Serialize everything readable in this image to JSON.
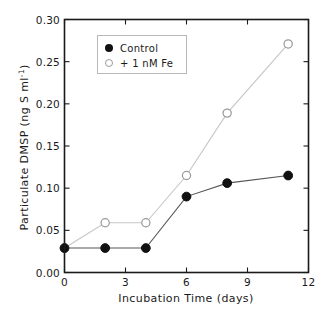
{
  "chart_data": {
    "type": "line",
    "title": "",
    "xlabel": "Incubation Time (days)",
    "ylabel_main": "Particulate DMSP (ng S ml",
    "ylabel_sup": "-1",
    "ylabel_tail": ")",
    "ylabel_full": "Particulate DMSP (ng S ml-1)",
    "xlim": [
      0,
      12
    ],
    "ylim": [
      0.0,
      0.3
    ],
    "xticks": [
      0,
      3,
      6,
      9,
      12
    ],
    "xtick_labels": [
      "0",
      "3",
      "6",
      "9",
      "12"
    ],
    "yticks": [
      0.0,
      0.05,
      0.1,
      0.15,
      0.2,
      0.25,
      0.3
    ],
    "ytick_labels": [
      "0.00",
      "0.05",
      "0.10",
      "0.15",
      "0.20",
      "0.25",
      "0.30"
    ],
    "grid": false,
    "legend_position": "upper-left-inside",
    "series": [
      {
        "name": "Control",
        "marker": "filled-circle",
        "color": "#111111",
        "line_color": "#555555",
        "x": [
          0,
          2,
          4,
          6,
          8,
          11
        ],
        "values": [
          0.029,
          0.029,
          0.029,
          0.09,
          0.106,
          0.115
        ]
      },
      {
        "name": "+ 1 nM Fe",
        "marker": "open-circle",
        "color": "#ffffff",
        "line_color": "#c6c6c6",
        "x": [
          0,
          2,
          4,
          6,
          8,
          11
        ],
        "values": [
          0.029,
          0.059,
          0.059,
          0.115,
          0.189,
          0.271
        ]
      }
    ]
  },
  "legend": {
    "entries": [
      {
        "label": "Control",
        "marker": "filled-circle"
      },
      {
        "label": "+ 1 nM Fe",
        "marker": "open-circle"
      }
    ]
  },
  "axes": {
    "x_title": "Incubation Time (days)",
    "y_title_prefix": "Particulate DMSP (ng S ml",
    "y_title_superscript": "-1",
    "y_title_suffix": ")"
  }
}
